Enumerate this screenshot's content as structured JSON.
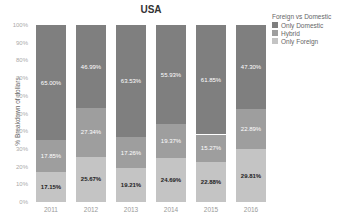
{
  "chart_data": {
    "type": "bar",
    "stacked": true,
    "title": "USA",
    "xlabel": "",
    "ylabel": "% Breakdown of dollars",
    "ylim": [
      0,
      100
    ],
    "yticks": [
      "0%",
      "10%",
      "20%",
      "30%",
      "40%",
      "50%",
      "60%",
      "70%",
      "80%",
      "90%",
      "100%"
    ],
    "categories": [
      "2011",
      "2012",
      "2013",
      "2014",
      "2015",
      "2016"
    ],
    "legend": {
      "title": "Foreign vs Domestic",
      "position": "right",
      "entries": [
        "Only Domestic",
        "Hybrid",
        "Only Foreign"
      ]
    },
    "series": [
      {
        "name": "Only Foreign",
        "color": "#c4c4c4",
        "values": [
          17.15,
          25.67,
          19.21,
          24.69,
          22.88,
          29.81
        ],
        "labels": [
          "17.15%",
          "25.67%",
          "19.21%",
          "24.69%",
          "22.88%",
          "29.81%"
        ]
      },
      {
        "name": "Hybrid",
        "color": "#9e9e9e",
        "values": [
          17.85,
          27.34,
          17.26,
          19.37,
          15.27,
          22.89
        ],
        "labels": [
          "17.85%",
          "27.34%",
          "17.26%",
          "19.37%",
          "15.27%",
          "22.89%"
        ]
      },
      {
        "name": "Only Domestic",
        "color": "#7f7f7f",
        "values": [
          65.0,
          46.99,
          63.53,
          55.93,
          61.85,
          47.3
        ],
        "labels": [
          "65.00%",
          "46.99%",
          "63.53%",
          "55.93%",
          "61.85%",
          "47.30%"
        ]
      }
    ],
    "grid": false
  }
}
